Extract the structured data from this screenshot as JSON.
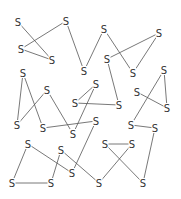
{
  "diagram": {
    "node_label": "S",
    "line_color": "#555555",
    "text_color": "#333333",
    "nodes": [
      {
        "id": "A",
        "x": 18,
        "y": 22
      },
      {
        "id": "B",
        "x": 66,
        "y": 21
      },
      {
        "id": "C",
        "x": 21,
        "y": 49
      },
      {
        "id": "D",
        "x": 52,
        "y": 60
      },
      {
        "id": "E",
        "x": 84,
        "y": 71
      },
      {
        "id": "F",
        "x": 104,
        "y": 29
      },
      {
        "id": "G",
        "x": 159,
        "y": 33
      },
      {
        "id": "H",
        "x": 107,
        "y": 59
      },
      {
        "id": "I",
        "x": 133,
        "y": 73
      },
      {
        "id": "J",
        "x": 164,
        "y": 70
      },
      {
        "id": "K",
        "x": 23,
        "y": 73
      },
      {
        "id": "L",
        "x": 47,
        "y": 90
      },
      {
        "id": "M",
        "x": 96,
        "y": 84
      },
      {
        "id": "N",
        "x": 137,
        "y": 92
      },
      {
        "id": "O",
        "x": 75,
        "y": 103
      },
      {
        "id": "P",
        "x": 119,
        "y": 105
      },
      {
        "id": "Q",
        "x": 167,
        "y": 108
      },
      {
        "id": "R",
        "x": 17,
        "y": 125
      },
      {
        "id": "S1",
        "x": 43,
        "y": 128
      },
      {
        "id": "T",
        "x": 73,
        "y": 134
      },
      {
        "id": "U",
        "x": 96,
        "y": 121
      },
      {
        "id": "V",
        "x": 131,
        "y": 125
      },
      {
        "id": "W",
        "x": 155,
        "y": 128
      },
      {
        "id": "X",
        "x": 28,
        "y": 144
      },
      {
        "id": "Y",
        "x": 61,
        "y": 150
      },
      {
        "id": "Z",
        "x": 105,
        "y": 144
      },
      {
        "id": "AA",
        "x": 132,
        "y": 144
      },
      {
        "id": "AB",
        "x": 72,
        "y": 173
      },
      {
        "id": "AC",
        "x": 12,
        "y": 183
      },
      {
        "id": "AD",
        "x": 51,
        "y": 183
      },
      {
        "id": "AE",
        "x": 99,
        "y": 183
      },
      {
        "id": "AF",
        "x": 143,
        "y": 183
      }
    ],
    "edges": [
      [
        "A",
        "D"
      ],
      [
        "B",
        "C"
      ],
      [
        "C",
        "D"
      ],
      [
        "B",
        "E"
      ],
      [
        "E",
        "F"
      ],
      [
        "F",
        "I"
      ],
      [
        "H",
        "G"
      ],
      [
        "G",
        "I"
      ],
      [
        "H",
        "P"
      ],
      [
        "O",
        "P"
      ],
      [
        "O",
        "M"
      ],
      [
        "M",
        "T"
      ],
      [
        "K",
        "R"
      ],
      [
        "K",
        "S1"
      ],
      [
        "L",
        "R"
      ],
      [
        "L",
        "T"
      ],
      [
        "S1",
        "U"
      ],
      [
        "U",
        "AB"
      ],
      [
        "N",
        "Q"
      ],
      [
        "J",
        "Q"
      ],
      [
        "J",
        "V"
      ],
      [
        "V",
        "W"
      ],
      [
        "X",
        "AC"
      ],
      [
        "X",
        "AB"
      ],
      [
        "AC",
        "AD"
      ],
      [
        "Y",
        "AD"
      ],
      [
        "Y",
        "AE"
      ],
      [
        "Z",
        "AA"
      ],
      [
        "Z",
        "AF"
      ],
      [
        "AA",
        "AE"
      ],
      [
        "W",
        "AF"
      ]
    ]
  }
}
